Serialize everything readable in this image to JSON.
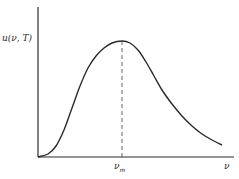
{
  "chart_data": {
    "type": "line",
    "title": "",
    "xlabel": "ν",
    "ylabel": "u(ν, T)",
    "x_ticks": [
      {
        "label": "ν_m",
        "position": "peak"
      }
    ],
    "grid": false,
    "legend": null,
    "series": [
      {
        "name": "u(ν, T)",
        "description": "Spectral energy density curve rising from origin to a single peak at ν_m then decaying",
        "points_px": [
          [
            38,
            157
          ],
          [
            48,
            154
          ],
          [
            56,
            146
          ],
          [
            64,
            130
          ],
          [
            72,
            108
          ],
          [
            80,
            86
          ],
          [
            88,
            68
          ],
          [
            96,
            56
          ],
          [
            104,
            48
          ],
          [
            112,
            43
          ],
          [
            122,
            41
          ],
          [
            130,
            43
          ],
          [
            138,
            50
          ],
          [
            146,
            62
          ],
          [
            154,
            76
          ],
          [
            162,
            90
          ],
          [
            172,
            104
          ],
          [
            182,
            116
          ],
          [
            192,
            126
          ],
          [
            202,
            134
          ],
          [
            212,
            140
          ],
          [
            222,
            145
          ]
        ]
      }
    ],
    "annotations": [
      {
        "type": "dashed-vertical-line",
        "at": "ν_m",
        "from": "x-axis",
        "to": "peak"
      }
    ],
    "colors": {
      "curve": "#2a2a2a",
      "axes": "#2a2a2a",
      "dashed": "#555555"
    }
  },
  "labels": {
    "ylabel": "u(ν, T)",
    "tick_vm_main": "ν",
    "tick_vm_sub": "m",
    "xlabel": "ν"
  }
}
